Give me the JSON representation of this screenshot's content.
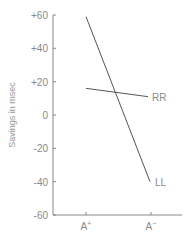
{
  "chart_data": {
    "type": "line",
    "title": "",
    "xlabel": "",
    "ylabel": "Savings in msec",
    "categories": [
      "A+",
      "A−"
    ],
    "category_labels": {
      "plus": "A",
      "plus_sup": "+",
      "minus": "A",
      "minus_sup": "−"
    },
    "ylim": [
      -60,
      60
    ],
    "yticks": [
      "+60",
      "+40",
      "+20",
      "0",
      "-20",
      "-40",
      "-60"
    ],
    "grid": false,
    "legend": "inline labels at line ends",
    "series": [
      {
        "name": "RR",
        "values": [
          16,
          11
        ],
        "color": "#555555"
      },
      {
        "name": "LL",
        "values": [
          59,
          -40
        ],
        "color": "#555555"
      }
    ]
  }
}
